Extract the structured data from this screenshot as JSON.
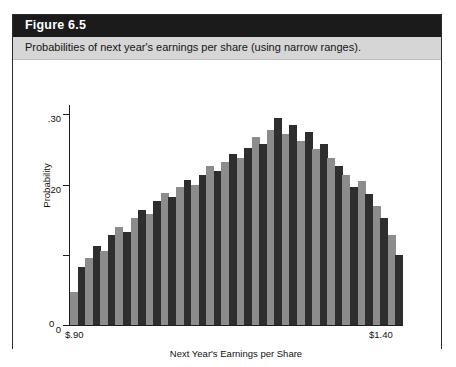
{
  "figure": {
    "title": "Figure 6.5",
    "caption": "Probabilities of next year's earnings per share (using narrow ranges).",
    "title_bar_color": "#1b1b1b",
    "caption_band_color": "#d6d6d6"
  },
  "chart_data": {
    "type": "bar",
    "title": "Probabilities of next year's earnings per share (using narrow ranges).",
    "xlabel": "Next Year's Earnings per Share",
    "ylabel": "Probability",
    "grid": false,
    "legend": null,
    "ylim": [
      0,
      0.3133
    ],
    "y_ticks": [
      0,
      0.1,
      0.2,
      0.3
    ],
    "y_tick_labels": [
      "0",
      "",
      ".20",
      ".30"
    ],
    "x_tick_labels": [
      "$.90",
      "$1.40"
    ],
    "xlim": [
      0.9,
      1.4
    ],
    "bar_colors": [
      "#8c8c8c",
      "#2e2e2e"
    ],
    "categories": [
      "0.900",
      "0.911",
      "0.923",
      "0.934",
      "0.945",
      "0.957",
      "0.968",
      "0.980",
      "0.991",
      "1.002",
      "1.014",
      "1.025",
      "1.036",
      "1.048",
      "1.059",
      "1.070",
      "1.082",
      "1.093",
      "1.105",
      "1.116",
      "1.127",
      "1.139",
      "1.150",
      "1.161",
      "1.173",
      "1.184",
      "1.195",
      "1.207",
      "1.218",
      "1.230",
      "1.241",
      "1.252",
      "1.264",
      "1.275",
      "1.286",
      "1.298",
      "1.309",
      "1.320",
      "1.332",
      "1.343",
      "1.355",
      "1.366",
      "1.377",
      "1.389"
    ],
    "values": [
      0.047,
      0.083,
      0.095,
      0.112,
      0.105,
      0.128,
      0.14,
      0.133,
      0.152,
      0.164,
      0.158,
      0.176,
      0.188,
      0.182,
      0.196,
      0.206,
      0.2,
      0.214,
      0.226,
      0.219,
      0.232,
      0.244,
      0.238,
      0.252,
      0.268,
      0.258,
      0.278,
      0.295,
      0.272,
      0.285,
      0.262,
      0.275,
      0.25,
      0.258,
      0.238,
      0.226,
      0.214,
      0.196,
      0.205,
      0.186,
      0.17,
      0.152,
      0.128,
      0.1
    ]
  }
}
